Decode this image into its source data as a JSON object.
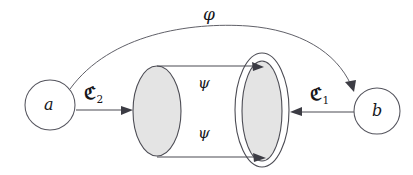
{
  "figure": {
    "type": "category-theory-diagram",
    "background_color": "#ffffff",
    "stroke_color": "#4a4a52",
    "fill_color": "#e4e4e4"
  },
  "nodes": {
    "source": {
      "label": "a",
      "cx": 50,
      "cy": 105,
      "r": 25
    },
    "target": {
      "label": "b",
      "cx": 377,
      "cy": 111,
      "r": 23
    }
  },
  "objects": {
    "left_cylinder": {
      "cx": 157,
      "cy": 111,
      "rx": 24,
      "ry": 45
    },
    "right_outer": {
      "cx": 262,
      "cy": 110,
      "rx": 27,
      "ry": 57
    },
    "right_inner": {
      "cx": 262,
      "cy": 111,
      "rx": 20,
      "ry": 50
    }
  },
  "arrows": {
    "phi": {
      "label": "φ",
      "label_x": 203,
      "label_y": 8,
      "description": "outer arc from a to b"
    },
    "c2": {
      "label_main": "ℭ",
      "label_sub": "2",
      "label_x": 84,
      "label_y": 88,
      "description": "arrow from a into left cylinder"
    },
    "c1": {
      "label_main": "ℭ",
      "label_sub": "1",
      "label_x": 310,
      "label_y": 89,
      "description": "arrow from b into right ellipse"
    },
    "psi_top": {
      "label": "ψ",
      "label_x": 198,
      "label_y": 77,
      "description": "top arrow left cylinder to right ellipse"
    },
    "psi_bottom": {
      "label": "ψ",
      "label_x": 198,
      "label_y": 127,
      "description": "bottom arrow left cylinder to right ellipse"
    }
  }
}
